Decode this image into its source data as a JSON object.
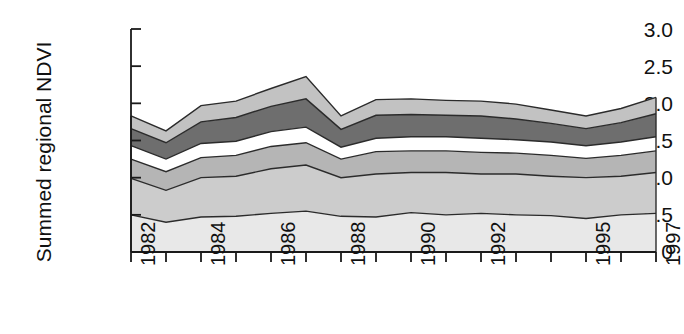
{
  "chart_data": {
    "type": "area",
    "title": "",
    "xlabel": "",
    "ylabel": "Summed regional NDVI",
    "ylim": [
      0,
      3.0
    ],
    "ytick_labels": [
      "3.0",
      "2.5",
      "2.0",
      "1.5",
      "1.0",
      "0.5",
      "0"
    ],
    "ytick_values": [
      3.0,
      2.5,
      2.0,
      1.5,
      1.0,
      0.5,
      0
    ],
    "grid": false,
    "legend": null,
    "stacked": true,
    "x": [
      1982,
      1983,
      1984,
      1985,
      1986,
      1987,
      1988,
      1989,
      1990,
      1991,
      1992,
      1993,
      1994,
      1995,
      1996,
      1997
    ],
    "xtick_labels": [
      "1982",
      "",
      "1984",
      "",
      "1986",
      "",
      "1988",
      "",
      "1990",
      "",
      "1992",
      "",
      "",
      "1995",
      "",
      "1997"
    ],
    "xtick_labels_shown": [
      "1982",
      "1984",
      "1986",
      "1988",
      "1990",
      "1992",
      "1995",
      "1997"
    ],
    "series": [
      {
        "name": "band-1",
        "color": "#e8e8e8",
        "values": [
          0.5,
          0.4,
          0.47,
          0.48,
          0.52,
          0.55,
          0.48,
          0.47,
          0.53,
          0.5,
          0.52,
          0.5,
          0.49,
          0.45,
          0.5,
          0.52
        ]
      },
      {
        "name": "band-2",
        "color": "#cccccc",
        "values": [
          0.49,
          0.43,
          0.53,
          0.54,
          0.6,
          0.62,
          0.52,
          0.58,
          0.54,
          0.57,
          0.53,
          0.55,
          0.53,
          0.55,
          0.52,
          0.55
        ]
      },
      {
        "name": "band-3",
        "color": "#b5b5b5",
        "values": [
          0.26,
          0.25,
          0.27,
          0.28,
          0.3,
          0.3,
          0.25,
          0.3,
          0.29,
          0.29,
          0.29,
          0.28,
          0.28,
          0.26,
          0.28,
          0.29
        ]
      },
      {
        "name": "band-4",
        "color": "#ffffff",
        "values": [
          0.18,
          0.17,
          0.19,
          0.19,
          0.2,
          0.21,
          0.16,
          0.18,
          0.19,
          0.19,
          0.19,
          0.18,
          0.18,
          0.17,
          0.18,
          0.19
        ]
      },
      {
        "name": "band-5",
        "color": "#6e6e6e",
        "values": [
          0.23,
          0.22,
          0.29,
          0.32,
          0.34,
          0.38,
          0.24,
          0.31,
          0.3,
          0.29,
          0.3,
          0.28,
          0.25,
          0.23,
          0.26,
          0.31
        ]
      },
      {
        "name": "band-6",
        "color": "#c2c2c2",
        "values": [
          0.17,
          0.16,
          0.22,
          0.22,
          0.24,
          0.3,
          0.18,
          0.21,
          0.21,
          0.2,
          0.2,
          0.2,
          0.18,
          0.17,
          0.19,
          0.22
        ]
      }
    ],
    "stack_tops": {
      "band-1": [
        0.5,
        0.4,
        0.47,
        0.48,
        0.52,
        0.55,
        0.48,
        0.47,
        0.53,
        0.5,
        0.52,
        0.5,
        0.49,
        0.45,
        0.5,
        0.52
      ],
      "band-2": [
        0.99,
        0.83,
        1.0,
        1.02,
        1.12,
        1.17,
        1.0,
        1.05,
        1.07,
        1.07,
        1.05,
        1.05,
        1.02,
        1.0,
        1.02,
        1.07
      ],
      "band-3": [
        1.25,
        1.08,
        1.27,
        1.3,
        1.42,
        1.47,
        1.25,
        1.35,
        1.36,
        1.36,
        1.34,
        1.33,
        1.3,
        1.26,
        1.3,
        1.36
      ],
      "band-4": [
        1.43,
        1.25,
        1.46,
        1.49,
        1.62,
        1.68,
        1.41,
        1.53,
        1.55,
        1.55,
        1.53,
        1.51,
        1.48,
        1.43,
        1.48,
        1.55
      ],
      "band-5": [
        1.66,
        1.47,
        1.75,
        1.81,
        1.96,
        2.06,
        1.65,
        1.84,
        1.85,
        1.84,
        1.83,
        1.79,
        1.73,
        1.66,
        1.74,
        1.86
      ],
      "band-6": [
        1.83,
        1.63,
        1.97,
        2.03,
        2.2,
        2.36,
        1.83,
        2.05,
        2.06,
        2.04,
        2.03,
        1.99,
        1.91,
        1.83,
        1.93,
        2.08
      ]
    },
    "totals": [
      1.83,
      1.63,
      1.97,
      2.03,
      2.2,
      2.36,
      1.83,
      2.05,
      2.06,
      2.04,
      2.03,
      1.99,
      1.91,
      1.83,
      1.93,
      2.08
    ]
  },
  "axes": {
    "line_color": "#1a1a1a"
  }
}
